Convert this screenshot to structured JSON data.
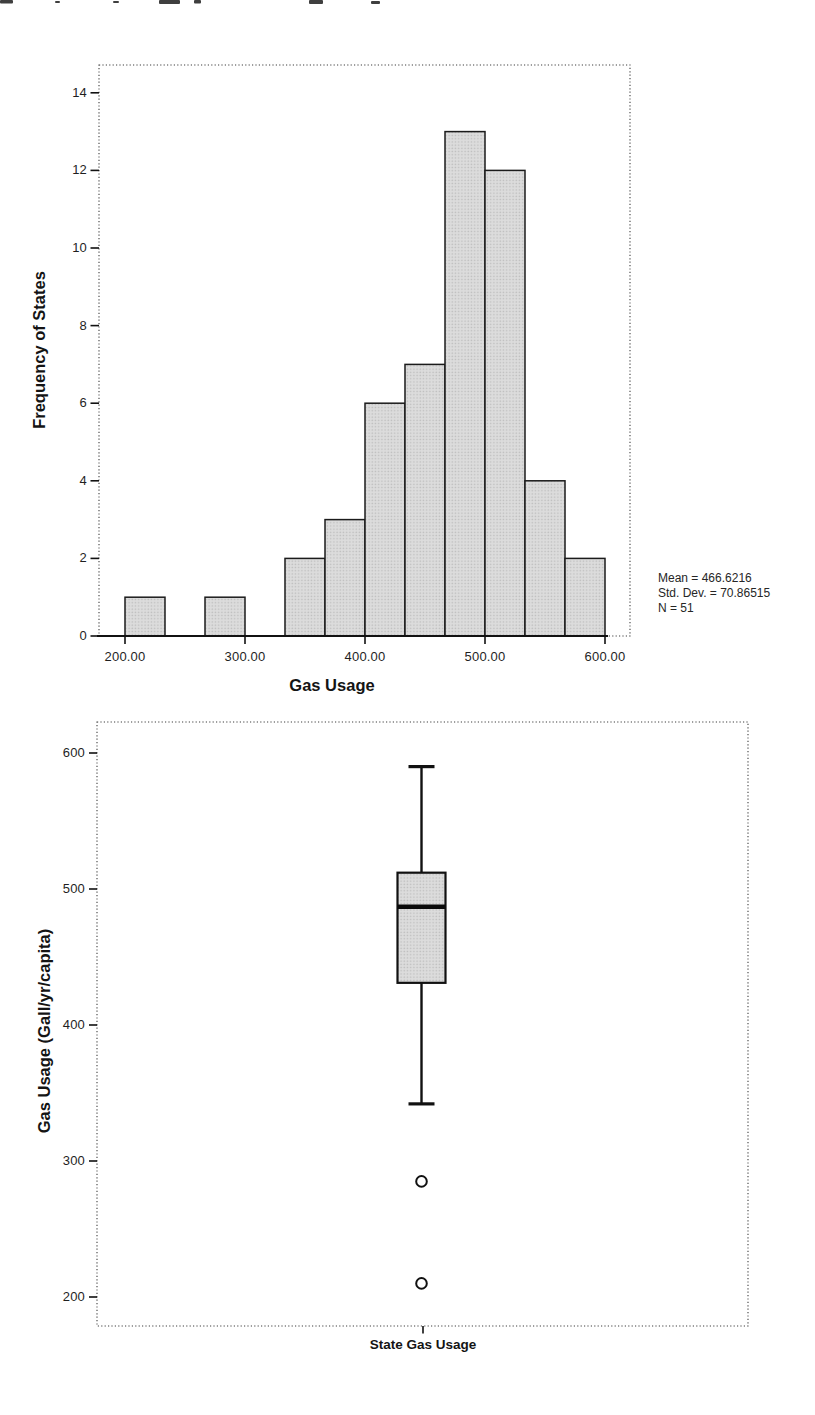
{
  "page": {
    "background": "#ffffff",
    "description": "Scanned statistics output page: SPSS histogram and boxplot of state gas usage"
  },
  "chart_data": [
    {
      "id": "gas-usage-histogram",
      "type": "bar",
      "subtype": "histogram",
      "title": "",
      "xlabel": "Gas Usage",
      "ylabel": "Frequency of States",
      "x_tick_values": [
        200,
        300,
        400,
        500,
        600
      ],
      "x_tick_labels": [
        "200.00",
        "300.00",
        "400.00",
        "500.00",
        "600.00"
      ],
      "y_ticks": [
        0,
        2,
        4,
        6,
        8,
        10,
        12,
        14
      ],
      "xlim": [
        178,
        621
      ],
      "ylim": [
        0,
        14.7
      ],
      "grid": false,
      "legend": "none",
      "bin_width": 33.33,
      "bins": [
        {
          "start": 200.0,
          "end": 233.33,
          "count": 1
        },
        {
          "start": 266.67,
          "end": 300.0,
          "count": 1
        },
        {
          "start": 333.33,
          "end": 366.67,
          "count": 2
        },
        {
          "start": 366.67,
          "end": 400.0,
          "count": 3
        },
        {
          "start": 400.0,
          "end": 433.33,
          "count": 6
        },
        {
          "start": 433.33,
          "end": 466.67,
          "count": 7
        },
        {
          "start": 466.67,
          "end": 500.0,
          "count": 13
        },
        {
          "start": 500.0,
          "end": 533.33,
          "count": 12
        },
        {
          "start": 533.33,
          "end": 566.67,
          "count": 4
        },
        {
          "start": 566.67,
          "end": 600.0,
          "count": 2
        }
      ],
      "n_total": 51,
      "annotations": [
        "Mean = 466.6216",
        "Std. Dev. = 70.86515",
        "N = 51"
      ],
      "colors": {
        "bar_fill": "#dcdcdc",
        "bar_fill_dot": "#bcbcbc",
        "bar_stroke": "#1b1b1b",
        "axis": "#111111",
        "frame": "#3f3f3f"
      }
    },
    {
      "id": "gas-usage-boxplot",
      "type": "boxplot",
      "title": "",
      "xlabel": "State Gas Usage",
      "ylabel": "Gas Usage (Gall/yr/capita)",
      "y_ticks": [
        200,
        300,
        400,
        500,
        600
      ],
      "ylim": [
        178,
        623
      ],
      "grid": false,
      "box": {
        "whisker_low": 342,
        "q1": 431,
        "median": 487,
        "q3": 512,
        "whisker_high": 590,
        "outliers": [
          285,
          210
        ]
      },
      "colors": {
        "box_fill": "#dcdcdc",
        "box_fill_dot": "#bcbcbc",
        "box_stroke": "#111111",
        "median": "#0a0a0a",
        "outlier_fill": "#ffffff",
        "frame": "#3f3f3f"
      }
    }
  ]
}
